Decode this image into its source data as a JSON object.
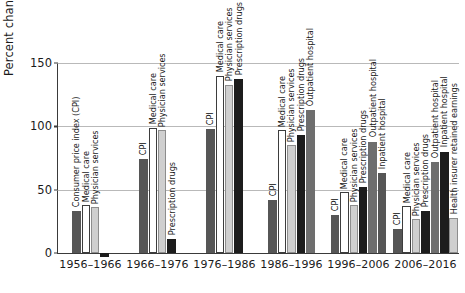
{
  "chart_data": {
    "type": "bar",
    "title": "",
    "xlabel": "",
    "ylabel": "Percent change",
    "ylim": [
      -10,
      150
    ],
    "yticks": [
      0,
      50,
      100,
      150
    ],
    "ytick_labels": [
      "0",
      "50",
      "100",
      "150"
    ],
    "grid": true,
    "legend": "none (per-bar inline rotated labels)",
    "categories": [
      "1956–1966",
      "1966–1976",
      "1976–1986",
      "1986–1996",
      "1996–2006",
      "2006–2016"
    ],
    "groups": [
      {
        "category": "1956–1966",
        "bars": [
          {
            "label": "Consumer price index (CPI)",
            "value": 33,
            "fill": "darkgray"
          },
          {
            "label": "Medical care",
            "value": 38,
            "fill": "white"
          },
          {
            "label": "Physician services",
            "value": 36,
            "fill": "lightgray"
          },
          {
            "label": "",
            "value": -3,
            "fill": "black"
          }
        ]
      },
      {
        "category": "1966–1976",
        "bars": [
          {
            "label": "CPI",
            "value": 74,
            "fill": "darkgray"
          },
          {
            "label": "Medical care",
            "value": 99,
            "fill": "white"
          },
          {
            "label": "Physician services",
            "value": 97,
            "fill": "lightgray"
          },
          {
            "label": "Prescription drugs",
            "value": 11,
            "fill": "black"
          }
        ]
      },
      {
        "category": "1976–1986",
        "bars": [
          {
            "label": "CPI",
            "value": 98,
            "fill": "darkgray"
          },
          {
            "label": "Medical care",
            "value": 140,
            "fill": "white"
          },
          {
            "label": "Physician services",
            "value": 133,
            "fill": "lightgray"
          },
          {
            "label": "Prescription drugs",
            "value": 137,
            "fill": "black"
          }
        ]
      },
      {
        "category": "1986–1996",
        "bars": [
          {
            "label": "CPI",
            "value": 42,
            "fill": "darkgray"
          },
          {
            "label": "Medical care",
            "value": 97,
            "fill": "white"
          },
          {
            "label": "Physician services",
            "value": 85,
            "fill": "lightgray"
          },
          {
            "label": "Prescription drugs",
            "value": 93,
            "fill": "black"
          },
          {
            "label": "Outpatient hospital",
            "value": 113,
            "fill": "midgray"
          }
        ]
      },
      {
        "category": "1996–2006",
        "bars": [
          {
            "label": "CPI",
            "value": 30,
            "fill": "darkgray"
          },
          {
            "label": "Medical care",
            "value": 48,
            "fill": "white"
          },
          {
            "label": "Physician services",
            "value": 38,
            "fill": "lightgray"
          },
          {
            "label": "Prescription drugs",
            "value": 52,
            "fill": "black"
          },
          {
            "label": "Outpatient hospital",
            "value": 88,
            "fill": "midgray"
          },
          {
            "label": "Inpatient hospital",
            "value": 63,
            "fill": "darkgray"
          }
        ]
      },
      {
        "category": "2006–2016",
        "bars": [
          {
            "label": "CPI",
            "value": 19,
            "fill": "darkgray"
          },
          {
            "label": "Medical care",
            "value": 37,
            "fill": "white"
          },
          {
            "label": "Physician services",
            "value": 27,
            "fill": "lightgray"
          },
          {
            "label": "Prescription drugs",
            "value": 33,
            "fill": "black"
          },
          {
            "label": "Outpatient hospital",
            "value": 72,
            "fill": "midgray"
          },
          {
            "label": "Inpatient hospital",
            "value": 80,
            "fill": "black"
          },
          {
            "label": "Health insurer retained earnings",
            "value": 28,
            "fill": "lightgray"
          }
        ]
      }
    ],
    "colors": {
      "darkgray": "#565656",
      "white": "#ffffff",
      "lightgray": "#cfcfcf",
      "black": "#1c1c1c",
      "midgray": "#6e6e6e",
      "gridline": "#b9b9b9",
      "axis": "#3a3a3a",
      "text": "#1a1a1a"
    }
  }
}
